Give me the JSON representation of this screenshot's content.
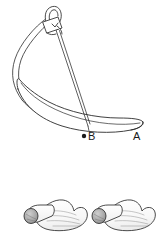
{
  "figure": {
    "background_color": "#ffffff",
    "line_color": "#2b2b2b",
    "shade_color": "#9a9a9a",
    "fill_color": "#ffffff",
    "labels": [
      {
        "id": "point-b",
        "text": "B",
        "marker": "dot",
        "x": 92,
        "y": 139
      },
      {
        "id": "point-a",
        "text": "A",
        "marker": "none",
        "x": 134,
        "y": 139
      }
    ],
    "panels": [
      {
        "name": "main-diagram",
        "parts": [
          {
            "name": "needle-holder-clamp",
            "type": "outline"
          },
          {
            "name": "needle-shaft",
            "type": "line"
          },
          {
            "name": "suture-loop",
            "type": "outline"
          },
          {
            "name": "curved-flap-body",
            "type": "outline"
          },
          {
            "name": "flap-tip",
            "type": "outline"
          }
        ]
      },
      {
        "name": "specimen-left",
        "parts": [
          {
            "name": "rolled-tube-end",
            "type": "shaded-circle"
          },
          {
            "name": "tube-segment",
            "type": "outline"
          },
          {
            "name": "flap-body-shaded",
            "type": "outline"
          }
        ]
      },
      {
        "name": "specimen-right",
        "parts": [
          {
            "name": "rolled-tube-end",
            "type": "shaded-circle"
          },
          {
            "name": "tube-segment",
            "type": "outline"
          },
          {
            "name": "flap-body-shaded",
            "type": "outline"
          }
        ]
      }
    ]
  }
}
